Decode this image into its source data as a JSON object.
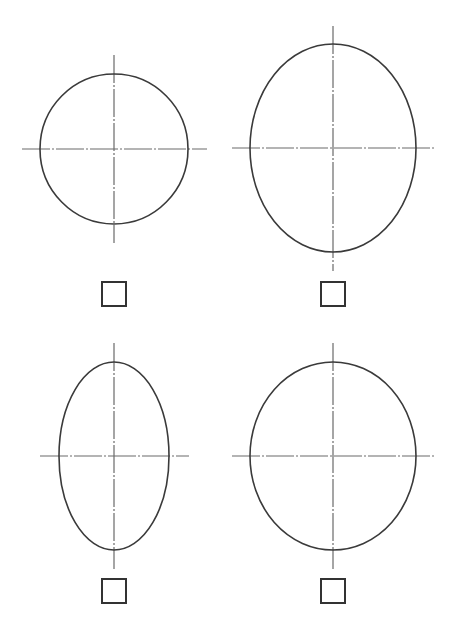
{
  "colors": {
    "background": "#ffffff",
    "shape_stroke": "#3a3a3a",
    "axis_stroke": "#6a6a6a",
    "checkbox_border": "#333333"
  },
  "options": [
    {
      "id": "option-1",
      "shape": "circle",
      "ellipse": {
        "cx": 114,
        "cy": 149,
        "rx": 74,
        "ry": 75
      },
      "h_axis": {
        "x1": 22,
        "x2": 207,
        "y": 149
      },
      "v_axis": {
        "y1": 55,
        "y2": 243,
        "x": 114
      },
      "checkbox": {
        "x": 101,
        "y": 281,
        "checked": false
      }
    },
    {
      "id": "option-2",
      "shape": "tall-wide-ellipse",
      "ellipse": {
        "cx": 333,
        "cy": 148,
        "rx": 83,
        "ry": 104
      },
      "h_axis": {
        "x1": 232,
        "x2": 434,
        "y": 148
      },
      "v_axis": {
        "y1": 26,
        "y2": 271,
        "x": 333
      },
      "checkbox": {
        "x": 320,
        "y": 281,
        "checked": false
      }
    },
    {
      "id": "option-3",
      "shape": "narrow-ellipse",
      "ellipse": {
        "cx": 114,
        "cy": 456,
        "rx": 55,
        "ry": 94
      },
      "h_axis": {
        "x1": 40,
        "x2": 189,
        "y": 456
      },
      "v_axis": {
        "y1": 343,
        "y2": 569,
        "x": 114
      },
      "checkbox": {
        "x": 101,
        "y": 578,
        "checked": false
      }
    },
    {
      "id": "option-4",
      "shape": "slightly-tall-ellipse",
      "ellipse": {
        "cx": 333,
        "cy": 456,
        "rx": 83,
        "ry": 94
      },
      "h_axis": {
        "x1": 232,
        "x2": 434,
        "y": 456
      },
      "v_axis": {
        "y1": 343,
        "y2": 569,
        "x": 333
      },
      "checkbox": {
        "x": 320,
        "y": 578,
        "checked": false
      }
    }
  ]
}
